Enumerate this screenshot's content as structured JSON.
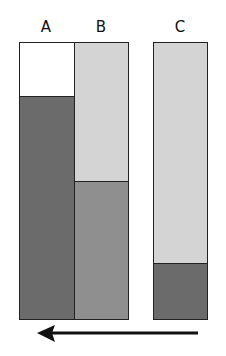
{
  "diagram": {
    "labels": {
      "a": "A",
      "b": "B",
      "c": "C"
    },
    "colors": {
      "white": "#ffffff",
      "light_gray": "#d4d4d4",
      "medium_gray": "#8f8f8f",
      "dark_gray": "#6b6b6b",
      "border": "#222222"
    },
    "bars": [
      {
        "name": "A",
        "segments": [
          {
            "color": "white",
            "fraction": 0.195
          },
          {
            "color": "dark_gray",
            "fraction": 0.805
          }
        ]
      },
      {
        "name": "B",
        "segments": [
          {
            "color": "light_gray",
            "fraction": 0.5
          },
          {
            "color": "medium_gray",
            "fraction": 0.5
          }
        ]
      },
      {
        "name": "C",
        "segments": [
          {
            "color": "light_gray",
            "fraction": 0.79
          },
          {
            "color": "dark_gray",
            "fraction": 0.21
          }
        ]
      }
    ],
    "arrow": {
      "direction": "left"
    }
  }
}
